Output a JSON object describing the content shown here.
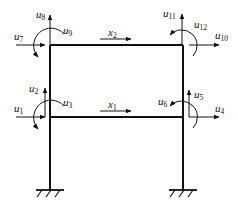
{
  "diagram": {
    "type": "two-story plane frame with degrees of freedom",
    "colors": {
      "stroke": "#111111",
      "background": "#ffffff"
    },
    "beams": [
      {
        "name": "x2",
        "label": "x",
        "sub": "2"
      },
      {
        "name": "x1",
        "label": "x",
        "sub": "1"
      }
    ],
    "dofs": [
      {
        "label": "u",
        "sub": "1"
      },
      {
        "label": "u",
        "sub": "2"
      },
      {
        "label": "u",
        "sub": "3"
      },
      {
        "label": "u",
        "sub": "4"
      },
      {
        "label": "u",
        "sub": "5"
      },
      {
        "label": "u",
        "sub": "6"
      },
      {
        "label": "u",
        "sub": "7"
      },
      {
        "label": "u",
        "sub": "8"
      },
      {
        "label": "u",
        "sub": "9"
      },
      {
        "label": "u",
        "sub": "10"
      },
      {
        "label": "u",
        "sub": "11"
      },
      {
        "label": "u",
        "sub": "12"
      }
    ]
  }
}
